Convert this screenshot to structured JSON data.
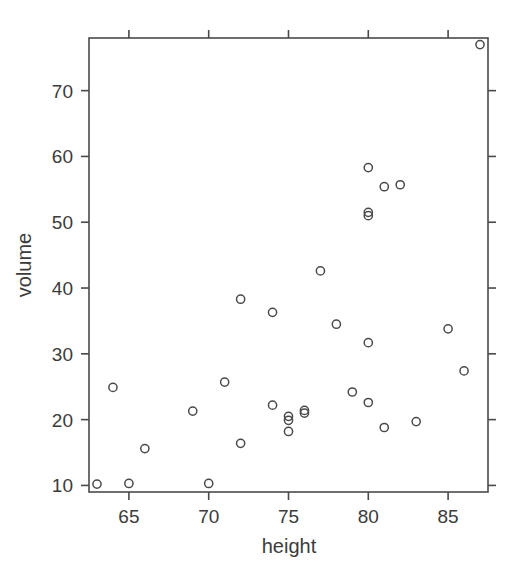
{
  "chart_data": {
    "type": "scatter",
    "title": "",
    "xlabel": "height",
    "ylabel": "volume",
    "xlim": [
      62.5,
      87.5
    ],
    "ylim": [
      9.0,
      78.0
    ],
    "grid": false,
    "legend": null,
    "marker": "open-circle",
    "marker_color": "#4a4a4a",
    "xticks": [
      65,
      70,
      75,
      80,
      85
    ],
    "xtick_labels": [
      "65",
      "70",
      "75",
      "80",
      "85"
    ],
    "yticks": [
      10,
      20,
      30,
      40,
      50,
      60,
      70
    ],
    "ytick_labels": [
      "10",
      "20",
      "30",
      "40",
      "50",
      "60",
      "70"
    ],
    "points": [
      {
        "x": 70,
        "y": 10.3
      },
      {
        "x": 65,
        "y": 10.3
      },
      {
        "x": 63,
        "y": 10.2
      },
      {
        "x": 72,
        "y": 16.4
      },
      {
        "x": 81,
        "y": 18.8
      },
      {
        "x": 83,
        "y": 19.7
      },
      {
        "x": 66,
        "y": 15.6
      },
      {
        "x": 75,
        "y": 18.2
      },
      {
        "x": 80,
        "y": 22.6
      },
      {
        "x": 75,
        "y": 19.9
      },
      {
        "x": 79,
        "y": 24.2
      },
      {
        "x": 76,
        "y": 21.0
      },
      {
        "x": 76,
        "y": 21.4
      },
      {
        "x": 69,
        "y": 21.3
      },
      {
        "x": 75,
        "y": 20.5
      },
      {
        "x": 74,
        "y": 22.2
      },
      {
        "x": 85,
        "y": 33.8
      },
      {
        "x": 86,
        "y": 27.4
      },
      {
        "x": 71,
        "y": 25.7
      },
      {
        "x": 64,
        "y": 24.9
      },
      {
        "x": 78,
        "y": 34.5
      },
      {
        "x": 80,
        "y": 31.7
      },
      {
        "x": 74,
        "y": 36.3
      },
      {
        "x": 72,
        "y": 38.3
      },
      {
        "x": 77,
        "y": 42.6
      },
      {
        "x": 81,
        "y": 55.4
      },
      {
        "x": 82,
        "y": 55.7
      },
      {
        "x": 80,
        "y": 58.3
      },
      {
        "x": 80,
        "y": 51.0
      },
      {
        "x": 80,
        "y": 51.5
      },
      {
        "x": 87,
        "y": 77.0
      }
    ]
  },
  "style": {
    "axis_color": "#4a4a4a",
    "text_color": "#3b3b3b",
    "background": "#ffffff"
  }
}
